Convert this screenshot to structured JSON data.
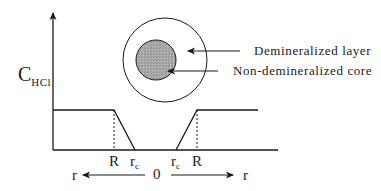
{
  "diagram": {
    "y_axis_label": {
      "main": "C",
      "sub": "HCl"
    },
    "legend": {
      "demineralized_layer": "Demineralized layer",
      "non_demineralized_core": "Non-demineralized core"
    },
    "x_ticks": {
      "left_R": "R",
      "left_rc": {
        "main": "r",
        "sub": "c"
      },
      "right_rc": {
        "main": "r",
        "sub": "c"
      },
      "right_R": "R"
    },
    "radial_axis": {
      "origin": "0",
      "left_label": "r",
      "right_label": "r"
    },
    "colors": {
      "line": "#1a1a1a",
      "core_fill": "#a9a9a9",
      "background": "#ffffff"
    }
  }
}
